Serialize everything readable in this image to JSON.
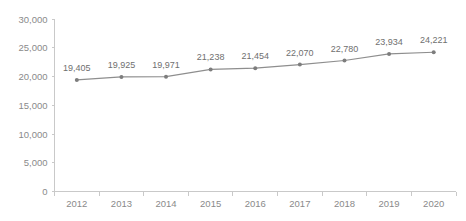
{
  "chart_data": {
    "type": "line",
    "title": "",
    "subtitle": "",
    "xlabel": "",
    "ylabel": "",
    "categories": [
      "2012",
      "2013",
      "2014",
      "2015",
      "2016",
      "2017",
      "2018",
      "2019",
      "2020"
    ],
    "values": [
      19405,
      19925,
      19971,
      21238,
      21454,
      22070,
      22780,
      23934,
      24221
    ],
    "point_labels": [
      "19,405",
      "19,925",
      "19,971",
      "21,238",
      "21,454",
      "22,070",
      "22,780",
      "23,934",
      "24,221"
    ],
    "series": [
      {
        "name": "",
        "values": [
          19405,
          19925,
          19971,
          21238,
          21454,
          22070,
          22780,
          23934,
          24221
        ]
      }
    ],
    "ylim": [
      0,
      30000
    ],
    "yticks": [
      0,
      5000,
      10000,
      15000,
      20000,
      25000,
      30000
    ],
    "ytick_labels": [
      "0",
      "5,000",
      "10,000",
      "15,000",
      "20,000",
      "25,000",
      "30,000"
    ],
    "grid": false,
    "legend": false,
    "legend_position": "none",
    "colors": {
      "line": "#8e8e8e",
      "marker": "#7d7d7d",
      "axis": "#c9c9c9",
      "tick_text": "#8a8a8a",
      "label_text": "#6f6f6f",
      "background": "#ffffff"
    }
  }
}
